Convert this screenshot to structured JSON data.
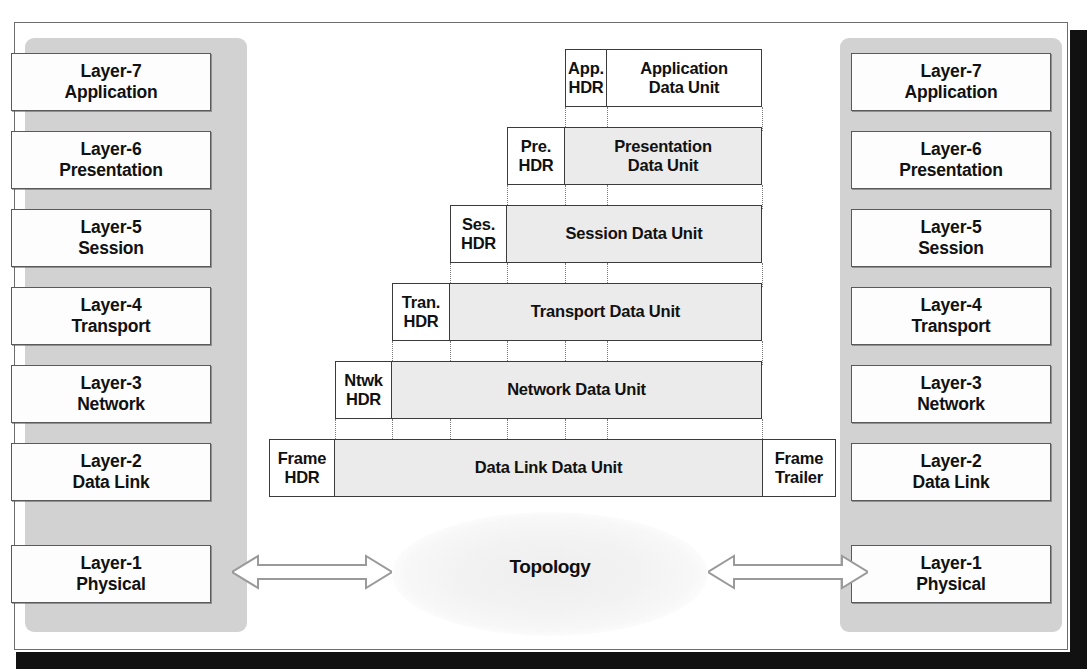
{
  "diagram": {
    "colors": {
      "panel_gray": "#d2d2d2",
      "data_unit_gray": "#ebebeb",
      "box_white": "#fdfdfd",
      "border_dark": "#3b3b3b",
      "text_black": "#111111",
      "shadow_black": "#111111"
    }
  },
  "left_stack": {
    "name": "left-host-layer-stack",
    "layers": [
      {
        "number": "Layer-7",
        "name": "Application"
      },
      {
        "number": "Layer-6",
        "name": "Presentation"
      },
      {
        "number": "Layer-5",
        "name": "Session"
      },
      {
        "number": "Layer-4",
        "name": "Transport"
      },
      {
        "number": "Layer-3",
        "name": "Network"
      },
      {
        "number": "Layer-2",
        "name": "Data Link"
      },
      {
        "number": "Layer-1",
        "name": "Physical"
      }
    ]
  },
  "right_stack": {
    "name": "right-host-layer-stack",
    "layers": [
      {
        "number": "Layer-7",
        "name": "Application"
      },
      {
        "number": "Layer-6",
        "name": "Presentation"
      },
      {
        "number": "Layer-5",
        "name": "Session"
      },
      {
        "number": "Layer-4",
        "name": "Transport"
      },
      {
        "number": "Layer-3",
        "name": "Network"
      },
      {
        "number": "Layer-2",
        "name": "Data Link"
      },
      {
        "number": "Layer-1",
        "name": "Physical"
      }
    ]
  },
  "encapsulation": {
    "rows": [
      {
        "id": "application",
        "header_line1": "App.",
        "header_line2": "HDR",
        "body_line1": "Application",
        "body_line2": "Data Unit",
        "trailer_line1": "",
        "trailer_line2": ""
      },
      {
        "id": "presentation",
        "header_line1": "Pre.",
        "header_line2": "HDR",
        "body_line1": "Presentation",
        "body_line2": "Data Unit",
        "trailer_line1": "",
        "trailer_line2": ""
      },
      {
        "id": "session",
        "header_line1": "Ses.",
        "header_line2": "HDR",
        "body_line1": "Session Data Unit",
        "body_line2": "",
        "trailer_line1": "",
        "trailer_line2": ""
      },
      {
        "id": "transport",
        "header_line1": "Tran.",
        "header_line2": "HDR",
        "body_line1": "Transport Data Unit",
        "body_line2": "",
        "trailer_line1": "",
        "trailer_line2": ""
      },
      {
        "id": "network",
        "header_line1": "Ntwk",
        "header_line2": "HDR",
        "body_line1": "Network Data Unit",
        "body_line2": "",
        "trailer_line1": "",
        "trailer_line2": ""
      },
      {
        "id": "data-link",
        "header_line1": "Frame",
        "header_line2": "HDR",
        "body_line1": "Data Link Data Unit",
        "body_line2": "",
        "trailer_line1": "Frame",
        "trailer_line2": "Trailer"
      }
    ]
  },
  "topology": {
    "label": "Topology",
    "left_arrow": "bidirectional-arrow",
    "right_arrow": "bidirectional-arrow"
  }
}
